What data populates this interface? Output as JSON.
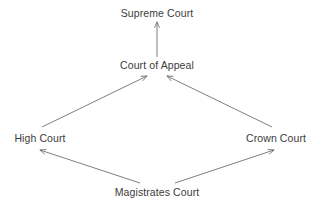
{
  "diagram": {
    "background_color": "#ffffff",
    "text_color": "#3b3b3b",
    "edge_color": "#6f6f77",
    "nodes": [
      {
        "id": "supreme-court",
        "label": "Supreme Court",
        "x": 157,
        "y": 13
      },
      {
        "id": "court-of-appeal",
        "label": "Court of Appeal",
        "x": 157,
        "y": 65
      },
      {
        "id": "high-court",
        "label": "High Court",
        "x": 40,
        "y": 138
      },
      {
        "id": "crown-court",
        "label": "Crown Court",
        "x": 276,
        "y": 138
      },
      {
        "id": "magistrates-court",
        "label": "Magistrates Court",
        "x": 157,
        "y": 192
      }
    ],
    "edges": [
      {
        "id": "edge-court-of-appeal-to-supreme-court",
        "from": "court-of-appeal",
        "to": "supreme-court",
        "x1": 157,
        "y1": 57,
        "x2": 157,
        "y2": 22,
        "arrow": "to"
      },
      {
        "id": "edge-high-court-to-court-of-appeal",
        "from": "high-court",
        "to": "court-of-appeal",
        "x1": 42,
        "y1": 127,
        "x2": 147,
        "y2": 76,
        "arrow": "to"
      },
      {
        "id": "edge-crown-court-to-court-of-appeal",
        "from": "crown-court",
        "to": "court-of-appeal",
        "x1": 272,
        "y1": 127,
        "x2": 167,
        "y2": 76,
        "arrow": "to"
      },
      {
        "id": "edge-magistrates-court-to-high-court",
        "from": "magistrates-court",
        "to": "high-court",
        "x1": 140,
        "y1": 183,
        "x2": 40,
        "y2": 150,
        "arrow": "to"
      },
      {
        "id": "edge-magistrates-court-to-crown-court",
        "from": "magistrates-court",
        "to": "crown-court",
        "x1": 175,
        "y1": 183,
        "x2": 274,
        "y2": 150,
        "arrow": "to"
      }
    ]
  }
}
